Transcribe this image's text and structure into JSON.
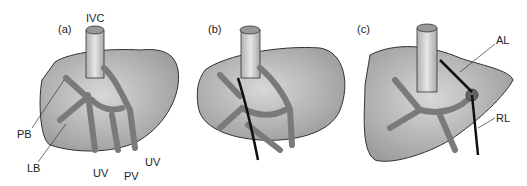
{
  "figure": {
    "panels": [
      {
        "id": "a",
        "label": "(a)"
      },
      {
        "id": "b",
        "label": "(b)"
      },
      {
        "id": "c",
        "label": "(c)"
      }
    ],
    "annotations": {
      "ivc": "IVC",
      "pb": "PB",
      "lb": "LB",
      "uv_left": "UV",
      "pv": "PV",
      "uv_right": "UV",
      "al": "AL",
      "rl": "RL"
    },
    "colors": {
      "liver_fill": "#b8b8b8",
      "vessel_fill": "#8f8f8f",
      "ivc_fill": "#d0d0d0",
      "outline": "#333333",
      "ligature": "#111111"
    }
  }
}
